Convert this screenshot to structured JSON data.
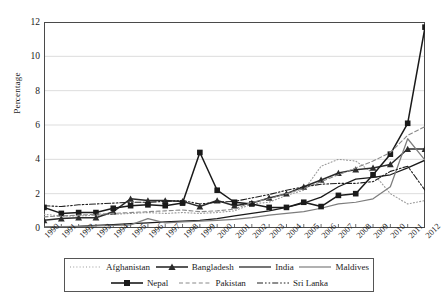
{
  "axes": {
    "ylabel": "Percentage",
    "yticks": [
      0,
      2,
      4,
      6,
      8,
      10,
      12
    ],
    "ylim": [
      0,
      12
    ],
    "xlabel": ""
  },
  "legend": {
    "row1": [
      "Afghanistan",
      "Bangladesh",
      "India",
      "Maldives"
    ],
    "row2": [
      "Nepal",
      "Pakistan",
      "Sri Lanka"
    ]
  },
  "chart_data": {
    "type": "line",
    "title": "",
    "xlabel": "",
    "ylabel": "Percentage",
    "ylim": [
      0,
      12
    ],
    "grid": true,
    "legend_position": "bottom",
    "categories": [
      "1990",
      "1991",
      "1992",
      "1993",
      "1994",
      "1995",
      "1996",
      "1997",
      "1998",
      "1999",
      "2000",
      "2001",
      "2002",
      "2003",
      "2004",
      "2005",
      "2006",
      "2007",
      "2008",
      "2009",
      "2010",
      "2011",
      "2012"
    ],
    "series": [
      {
        "name": "Afghanistan",
        "style": "dotted",
        "marker": "none",
        "color": "#9a9a9a",
        "values": [
          0.8,
          0.7,
          0.7,
          0.75,
          0.8,
          0.85,
          0.9,
          0.85,
          0.9,
          0.85,
          0.9,
          1.0,
          1.4,
          1.5,
          1.9,
          2.2,
          3.6,
          4.0,
          3.9,
          3.2,
          2.0,
          1.4,
          1.6
        ]
      },
      {
        "name": "Bangladesh",
        "style": "solid",
        "marker": "triangle",
        "color": "#2b2b2b",
        "values": [
          0.45,
          0.55,
          0.6,
          0.6,
          0.95,
          1.7,
          1.6,
          1.6,
          1.55,
          1.25,
          1.6,
          1.3,
          1.45,
          1.75,
          2.0,
          2.4,
          2.8,
          3.2,
          3.4,
          3.5,
          3.7,
          4.6,
          4.6
        ]
      },
      {
        "name": "India",
        "style": "solid",
        "marker": "none",
        "color": "#1a1a1a",
        "values": [
          0.05,
          0.08,
          0.1,
          0.15,
          0.2,
          0.25,
          0.3,
          0.35,
          0.4,
          0.45,
          0.55,
          0.7,
          0.85,
          1.0,
          1.2,
          1.45,
          1.8,
          2.4,
          2.85,
          2.95,
          3.1,
          3.5,
          3.95
        ]
      },
      {
        "name": "Maldives",
        "style": "solid",
        "marker": "none",
        "color": "#7d7d7d",
        "values": [
          0.05,
          0.08,
          0.1,
          0.12,
          0.15,
          0.18,
          0.55,
          0.3,
          0.35,
          0.4,
          0.45,
          0.5,
          0.6,
          0.75,
          0.85,
          0.95,
          1.15,
          1.4,
          1.5,
          1.7,
          2.4,
          5.2,
          3.95
        ]
      },
      {
        "name": "Nepal",
        "style": "solid",
        "marker": "square",
        "color": "#1a1a1a",
        "values": [
          1.2,
          0.85,
          0.9,
          0.9,
          1.15,
          1.3,
          1.35,
          1.3,
          1.45,
          4.4,
          2.2,
          1.5,
          1.4,
          1.2,
          1.2,
          1.5,
          1.25,
          1.9,
          2.0,
          3.1,
          4.3,
          6.1,
          11.7
        ]
      },
      {
        "name": "Pakistan",
        "style": "dashed",
        "marker": "none",
        "color": "#8a8a8a",
        "values": [
          0.65,
          0.7,
          0.75,
          0.8,
          0.85,
          0.9,
          0.95,
          1.0,
          1.05,
          0.95,
          1.0,
          1.1,
          1.5,
          1.7,
          2.0,
          2.3,
          2.7,
          3.1,
          3.5,
          3.9,
          4.4,
          5.4,
          5.9
        ]
      },
      {
        "name": "Sri Lanka",
        "style": "dashdot",
        "marker": "none",
        "color": "#1f1f1f",
        "values": [
          1.3,
          1.25,
          1.35,
          1.4,
          1.45,
          1.5,
          1.5,
          1.55,
          1.6,
          1.4,
          1.5,
          1.55,
          1.75,
          1.95,
          2.2,
          2.4,
          2.55,
          2.6,
          2.6,
          2.7,
          3.3,
          3.6,
          2.2
        ]
      }
    ]
  }
}
